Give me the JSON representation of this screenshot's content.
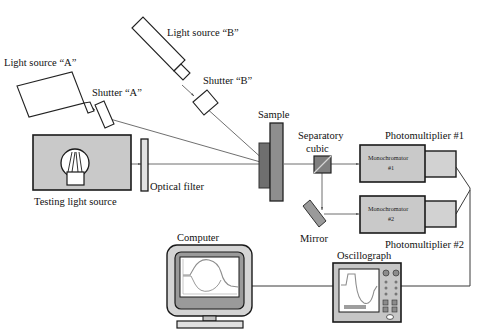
{
  "figure": {
    "type": "schematic-diagram",
    "width": 488,
    "height": 330,
    "background_color": "#ffffff",
    "line_color": "#222222",
    "fill_grey": "#c9c9c9",
    "fill_dark": "#6f6f6f",
    "fill_mid": "#8a8a8a"
  },
  "labels": {
    "light_source_a": "Light source “A”",
    "light_source_b": "Light source “B”",
    "shutter_a": "Shutter “A”",
    "shutter_b": "Shutter “B”",
    "testing_light_source": "Testing light source",
    "optical_filter": "Optical filter",
    "sample": "Sample",
    "separatory_cubic_line1": "Separatory",
    "separatory_cubic_line2": "cubic",
    "mirror": "Mirror",
    "monochromator_1_line1": "Monochromator",
    "monochromator_1_line2": "#1",
    "monochromator_2_line1": "Monochromator",
    "monochromator_2_line2": "#2",
    "photomultiplier_1": "Photomultiplier #1",
    "photomultiplier_2": "Photomultiplier #2",
    "computer": "Computer",
    "oscillograph": "Oscillograph"
  },
  "components": [
    {
      "id": "light-source-a",
      "name": "Light source “A”",
      "kind": "tilted-rectangle-emitter"
    },
    {
      "id": "light-source-b",
      "name": "Light source “B”",
      "kind": "tilted-rectangle-emitter"
    },
    {
      "id": "shutter-a",
      "name": "Shutter “A”",
      "kind": "tilted-slab"
    },
    {
      "id": "shutter-b",
      "name": "Shutter “B”",
      "kind": "tilted-slab"
    },
    {
      "id": "testing-light-source",
      "name": "Testing light source",
      "kind": "grey-box-with-bulb"
    },
    {
      "id": "optical-filter",
      "name": "Optical filter",
      "kind": "vertical-slab"
    },
    {
      "id": "sample",
      "name": "Sample",
      "kind": "stacked-vertical-slabs"
    },
    {
      "id": "separatory-cubic",
      "name": "Separatory cubic",
      "kind": "beamsplitter-cube"
    },
    {
      "id": "mirror",
      "name": "Mirror",
      "kind": "tilted-mirror"
    },
    {
      "id": "monochromator-1",
      "name": "Monochromator #1",
      "kind": "grey-box"
    },
    {
      "id": "monochromator-2",
      "name": "Monochromator #2",
      "kind": "grey-box"
    },
    {
      "id": "photomultiplier-1",
      "name": "Photomultiplier #1",
      "kind": "grey-box"
    },
    {
      "id": "photomultiplier-2",
      "name": "Photomultiplier #2",
      "kind": "grey-box"
    },
    {
      "id": "computer",
      "name": "Computer",
      "kind": "crt-monitor-with-waveform"
    },
    {
      "id": "oscillograph",
      "name": "Oscillograph",
      "kind": "instrument-with-screen-and-knobs"
    }
  ],
  "connections": [
    {
      "from": "light-source-a",
      "to": "shutter-a",
      "kind": "optical-beam"
    },
    {
      "from": "shutter-a",
      "to": "sample",
      "kind": "optical-beam"
    },
    {
      "from": "light-source-b",
      "to": "shutter-b",
      "kind": "optical-beam"
    },
    {
      "from": "shutter-b",
      "to": "sample",
      "kind": "optical-beam"
    },
    {
      "from": "testing-light-source",
      "to": "optical-filter",
      "kind": "optical-beam"
    },
    {
      "from": "optical-filter",
      "to": "sample",
      "kind": "optical-beam"
    },
    {
      "from": "sample",
      "to": "separatory-cubic",
      "kind": "optical-beam"
    },
    {
      "from": "separatory-cubic",
      "to": "monochromator-1",
      "kind": "optical-beam"
    },
    {
      "from": "separatory-cubic",
      "to": "mirror",
      "kind": "optical-beam"
    },
    {
      "from": "mirror",
      "to": "monochromator-2",
      "kind": "optical-beam"
    },
    {
      "from": "monochromator-1",
      "to": "photomultiplier-1",
      "kind": "coupling"
    },
    {
      "from": "monochromator-2",
      "to": "photomultiplier-2",
      "kind": "coupling"
    },
    {
      "from": "photomultiplier-1",
      "to": "oscillograph",
      "kind": "signal-wire"
    },
    {
      "from": "photomultiplier-2",
      "to": "oscillograph",
      "kind": "signal-wire"
    },
    {
      "from": "oscillograph",
      "to": "computer",
      "kind": "signal-wire"
    }
  ]
}
